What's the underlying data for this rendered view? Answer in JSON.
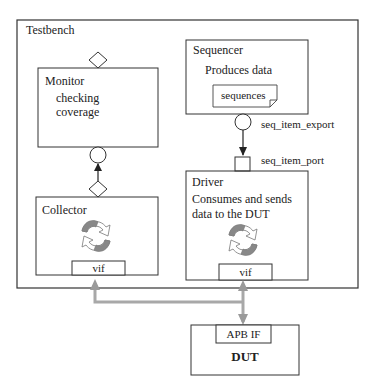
{
  "diagram": {
    "testbench": {
      "label": "Testbench"
    },
    "monitor": {
      "title": "Monitor",
      "lines": [
        "checking",
        "coverage"
      ]
    },
    "sequencer": {
      "title": "Sequencer",
      "description": "Produces data",
      "note": "sequences"
    },
    "driver": {
      "title": "Driver",
      "lines": [
        "Consumes and sends",
        "data to the DUT"
      ],
      "interface": "vif"
    },
    "collector": {
      "title": "Collector",
      "interface": "vif"
    },
    "dut": {
      "title": "DUT",
      "interface": "APB IF"
    },
    "connections": {
      "export_label": "seq_item_export",
      "port_label": "seq_item_port"
    },
    "colors": {
      "line": "#333333",
      "bus": "#a8a8a8",
      "arrow_gray": "#9a9a9a",
      "arrow_fill": "#ffffff"
    }
  }
}
